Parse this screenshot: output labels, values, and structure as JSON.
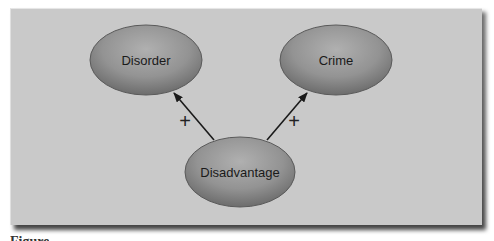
{
  "diagram": {
    "nodes": [
      {
        "id": "disorder",
        "label": "Disorder"
      },
      {
        "id": "crime",
        "label": "Crime"
      },
      {
        "id": "disadvantage",
        "label": "Disadvantage"
      }
    ],
    "edges": [
      {
        "from": "disadvantage",
        "to": "disorder",
        "sign": "+"
      },
      {
        "from": "disadvantage",
        "to": "crime",
        "sign": "+"
      }
    ],
    "colors": {
      "panel": "#c9c9c9",
      "node_fill_light": "#a8a8a8",
      "node_fill_dark": "#777777",
      "arrow": "#1a1a1a"
    }
  },
  "caption": {
    "text": "Figure"
  }
}
